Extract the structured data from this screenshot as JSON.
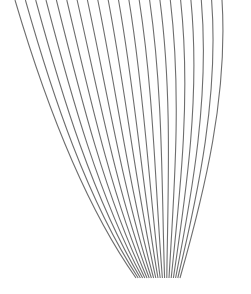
{
  "artwork": {
    "description": "abstract line art of curved lines converging at bottom",
    "line_color": "#6e6e6e",
    "background": "#ffffff",
    "line_count": 21,
    "top_y": 0,
    "bottom_y": 278,
    "top_x_start": 15,
    "top_x_end": 222,
    "bottom_x_start": 136,
    "bottom_x_end": 180
  }
}
